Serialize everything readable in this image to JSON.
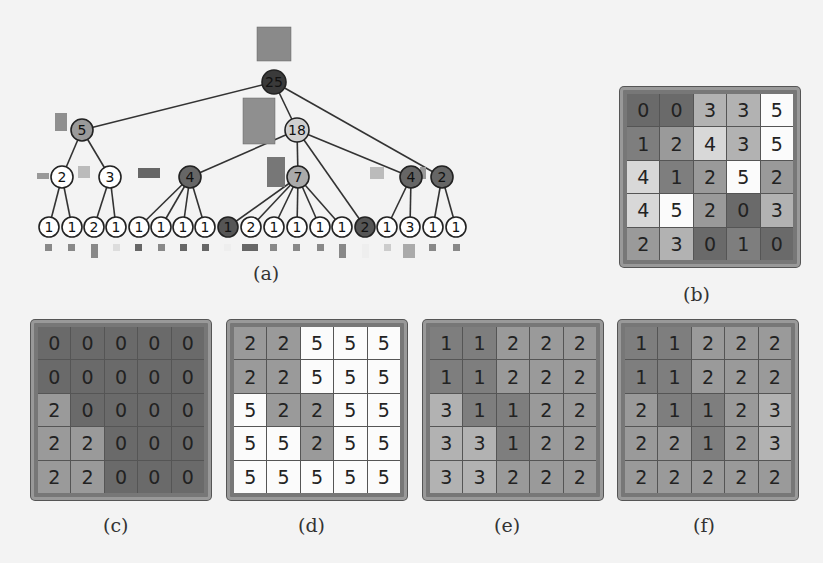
{
  "labels": {
    "a": "(a)",
    "b": "(b)",
    "c": "(c)",
    "d": "(d)",
    "e": "(e)",
    "f": "(f)"
  },
  "palette": {
    "0": "#6a6a6a",
    "1": "#7e7e7e",
    "2": "#9a9a9a",
    "3": "#b2b2b2",
    "4": "#d8d8d8",
    "5": "#fbfbfb"
  },
  "tree": {
    "root": {
      "value": "25",
      "shade": "#3a3a3a"
    },
    "level1": [
      {
        "value": "5",
        "shade": "#9a9a9a"
      },
      {
        "value": "18",
        "shade": "#d0d0d0"
      },
      {
        "value": "2",
        "shade": "#666666"
      }
    ],
    "level2": [
      {
        "value": "2",
        "shade": "#ffffff"
      },
      {
        "value": "3",
        "shade": "#ffffff"
      },
      {
        "value": "4",
        "shade": "#666666"
      },
      {
        "value": "7",
        "shade": "#aaaaaa"
      },
      {
        "value": "4",
        "shade": "#666666"
      }
    ],
    "leaves": [
      {
        "value": "1",
        "shade": "#ffffff"
      },
      {
        "value": "1",
        "shade": "#ffffff"
      },
      {
        "value": "2",
        "shade": "#ffffff"
      },
      {
        "value": "1",
        "shade": "#ffffff"
      },
      {
        "value": "1",
        "shade": "#ffffff"
      },
      {
        "value": "1",
        "shade": "#ffffff"
      },
      {
        "value": "1",
        "shade": "#ffffff"
      },
      {
        "value": "1",
        "shade": "#ffffff"
      },
      {
        "value": "1",
        "shade": "#555555"
      },
      {
        "value": "2",
        "shade": "#ffffff"
      },
      {
        "value": "1",
        "shade": "#ffffff"
      },
      {
        "value": "1",
        "shade": "#ffffff"
      },
      {
        "value": "1",
        "shade": "#ffffff"
      },
      {
        "value": "1",
        "shade": "#ffffff"
      },
      {
        "value": "2",
        "shade": "#555555"
      },
      {
        "value": "1",
        "shade": "#ffffff"
      },
      {
        "value": "3",
        "shade": "#ffffff"
      },
      {
        "value": "1",
        "shade": "#ffffff"
      },
      {
        "value": "1",
        "shade": "#ffffff"
      }
    ]
  },
  "grids": {
    "b": [
      [
        "0",
        "0",
        "3",
        "3",
        "5"
      ],
      [
        "1",
        "2",
        "4",
        "3",
        "5"
      ],
      [
        "4",
        "1",
        "2",
        "5",
        "2"
      ],
      [
        "4",
        "5",
        "2",
        "0",
        "3"
      ],
      [
        "2",
        "3",
        "0",
        "1",
        "0"
      ]
    ],
    "c": [
      [
        "0",
        "0",
        "0",
        "0",
        "0"
      ],
      [
        "0",
        "0",
        "0",
        "0",
        "0"
      ],
      [
        "2",
        "0",
        "0",
        "0",
        "0"
      ],
      [
        "2",
        "2",
        "0",
        "0",
        "0"
      ],
      [
        "2",
        "2",
        "0",
        "0",
        "0"
      ]
    ],
    "d": [
      [
        "2",
        "2",
        "5",
        "5",
        "5"
      ],
      [
        "2",
        "2",
        "5",
        "5",
        "5"
      ],
      [
        "5",
        "2",
        "2",
        "5",
        "5"
      ],
      [
        "5",
        "5",
        "2",
        "5",
        "5"
      ],
      [
        "5",
        "5",
        "5",
        "5",
        "5"
      ]
    ],
    "e": [
      [
        "1",
        "1",
        "2",
        "2",
        "2"
      ],
      [
        "1",
        "1",
        "2",
        "2",
        "2"
      ],
      [
        "3",
        "1",
        "1",
        "2",
        "2"
      ],
      [
        "3",
        "3",
        "1",
        "2",
        "2"
      ],
      [
        "3",
        "3",
        "2",
        "2",
        "2"
      ]
    ],
    "f": [
      [
        "1",
        "1",
        "2",
        "2",
        "2"
      ],
      [
        "1",
        "1",
        "2",
        "2",
        "2"
      ],
      [
        "2",
        "1",
        "1",
        "2",
        "3"
      ],
      [
        "2",
        "2",
        "1",
        "2",
        "3"
      ],
      [
        "2",
        "2",
        "2",
        "2",
        "2"
      ]
    ]
  }
}
